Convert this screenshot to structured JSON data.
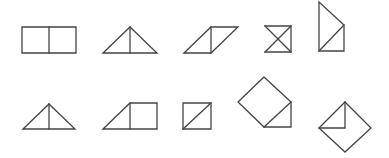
{
  "diagram": {
    "background": "#ffffff",
    "stroke_color": "#444444",
    "stroke_width": 1.3,
    "rows": [
      {
        "name": "row-1",
        "shapes": [
          {
            "name": "two-squares-shape",
            "paths": [
              "M22,27 L76,27 L76,53 L22,53 Z",
              "M49,27 L49,53"
            ]
          },
          {
            "name": "split-triangle-shape",
            "paths": [
              "M103,53 L130,27 L157,53 Z",
              "M130,27 L130,53"
            ]
          },
          {
            "name": "parallelogram-shape",
            "paths": [
              "M184,53 L211,27 L238,27 L211,53 Z",
              "M211,27 L211,53"
            ]
          },
          {
            "name": "hourglass-square-shape",
            "paths": [
              "M265,26 L291,26 L291,52 L265,52",
              "M265,26 L291,52",
              "M291,26 L265,52"
            ]
          },
          {
            "name": "tall-trapezoid-shape",
            "paths": [
              "M319,2 L344,25 L344,51 L319,51 Z",
              "M319,51 L344,25"
            ]
          }
        ]
      },
      {
        "name": "row-2",
        "shapes": [
          {
            "name": "split-triangle-shape-2",
            "paths": [
              "M23,129 L49,104 L75,129 Z",
              "M49,104 L49,129"
            ]
          },
          {
            "name": "triangle-square-shape",
            "paths": [
              "M103,129 L130,103 L157,103 L157,129 Z",
              "M130,103 L130,129"
            ]
          },
          {
            "name": "diagonal-square-shape",
            "paths": [
              "M183,103 L211,103 L211,129 L183,129 Z",
              "M183,129 L211,103"
            ]
          },
          {
            "name": "rotated-square-triangle-shape",
            "paths": [
              "M264,77 L291,102 L264,127 L238,102 Z",
              "M291,102 L291,127 L264,127"
            ]
          },
          {
            "name": "envelope-diamond-shape",
            "paths": [
              "M345,102 L371,128 L345,152 L319,128 Z",
              "M345,102 L345,128 L319,128"
            ]
          }
        ]
      }
    ]
  }
}
